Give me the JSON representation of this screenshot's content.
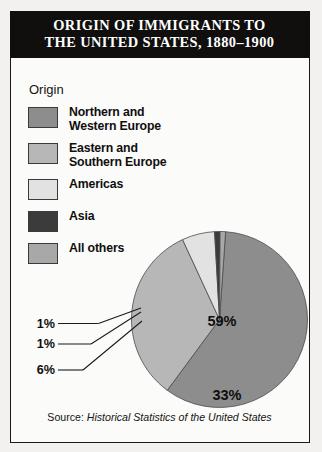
{
  "title": {
    "line1": "ORIGIN OF IMMIGRANTS TO",
    "line2": "THE UNITED STATES, 1880–1900"
  },
  "legend": {
    "heading": "Origin",
    "items": [
      {
        "label_line1": "Northern and",
        "label_line2": "Western Europe",
        "color": "#8d8d8d"
      },
      {
        "label_line1": "Eastern and",
        "label_line2": "Southern Europe",
        "color": "#b7b7b7"
      },
      {
        "label_line1": "Americas",
        "label_line2": "",
        "color": "#e2e2e2"
      },
      {
        "label_line1": "Asia",
        "label_line2": "",
        "color": "#3b3b3b"
      },
      {
        "label_line1": "All others",
        "label_line2": "",
        "color": "#a8a8a8"
      }
    ]
  },
  "source": {
    "prefix": "Source:",
    "title": "Historical Statistics of the United States"
  },
  "chart_data": {
    "type": "pie",
    "title": "ORIGIN OF IMMIGRANTS TO THE UNITED STATES, 1880–1900",
    "legend_title": "Origin",
    "legend_position": "top-left",
    "categories": [
      "Northern and Western Europe",
      "Eastern and Southern Europe",
      "Americas",
      "Asia",
      "All others"
    ],
    "values": [
      59,
      33,
      6,
      1,
      1
    ],
    "unit": "percent",
    "labels": [
      "59%",
      "33%",
      "6%",
      "1%",
      "1%"
    ],
    "colors": [
      "#8d8d8d",
      "#b7b7b7",
      "#e2e2e2",
      "#3b3b3b",
      "#a8a8a8"
    ],
    "label_placement": [
      "inside",
      "inside",
      "leader-line",
      "leader-line",
      "leader-line"
    ],
    "source": "Historical Statistics of the United States"
  }
}
